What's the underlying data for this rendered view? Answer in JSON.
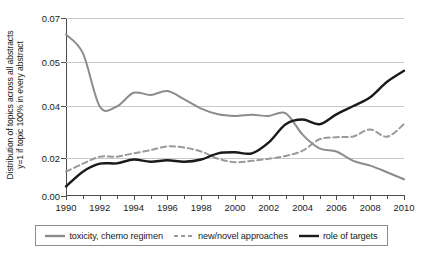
{
  "chart_data": {
    "type": "line",
    "title": "",
    "xlabel": "",
    "ylabel": "Distribution of topics across all abstracts y=1 if topic 100% in every abstract",
    "ylabel_line1": "Distribution of topics across all abstracts",
    "ylabel_line2": "y=1 if topic 100% in every abstract",
    "grid": true,
    "legend_position": "bottom",
    "xlim": [
      1990,
      2010
    ],
    "ylim": [
      0.0,
      0.07
    ],
    "xticks": [
      1990,
      1991,
      1992,
      1993,
      1994,
      1995,
      1996,
      1997,
      1998,
      1999,
      2000,
      2001,
      2002,
      2003,
      2004,
      2005,
      2006,
      2007,
      2008,
      2009,
      2010
    ],
    "xtick_labels": [
      "1990",
      "",
      "1992",
      "",
      "1994",
      "",
      "1996",
      "",
      "1998",
      "",
      "2000",
      "",
      "2002",
      "",
      "2004",
      "",
      "2006",
      "",
      "2008",
      "",
      "2010"
    ],
    "yticks": [
      0.0,
      0.02,
      0.04,
      0.05,
      0.07
    ],
    "ytick_labels": [
      "0.00",
      "0.02",
      "0.04",
      "0.05",
      "0.07"
    ],
    "x": [
      1990,
      1991,
      1992,
      1993,
      1994,
      1995,
      1996,
      1997,
      1998,
      1999,
      2000,
      2001,
      2002,
      2003,
      2004,
      2005,
      2006,
      2007,
      2008,
      2009,
      2010
    ],
    "series": [
      {
        "name": "toxicity, chemo regimen",
        "color": "#8c8c8c",
        "style": "solid",
        "width": 2.0,
        "values": [
          0.0625,
          0.054,
          0.0398,
          0.0398,
          0.043,
          0.0425,
          0.0434,
          0.0415,
          0.039,
          0.0368,
          0.0362,
          0.0366,
          0.0362,
          0.0372,
          0.029,
          0.0237,
          0.0225,
          0.0185,
          0.016,
          0.0125,
          0.0088
        ]
      },
      {
        "name": "new/novel approaches",
        "color": "#9a9a9a",
        "style": "dashed",
        "width": 2.0,
        "values": [
          0.0128,
          0.017,
          0.0205,
          0.0205,
          0.0218,
          0.023,
          0.0245,
          0.024,
          0.0225,
          0.0196,
          0.0178,
          0.0185,
          0.0196,
          0.0208,
          0.0228,
          0.0272,
          0.028,
          0.0283,
          0.031,
          0.0282,
          0.033
        ]
      },
      {
        "name": "role of targets",
        "color": "#1a1a1a",
        "style": "solid",
        "width": 2.4,
        "values": [
          0.005,
          0.0128,
          0.017,
          0.0172,
          0.0192,
          0.018,
          0.0188,
          0.018,
          0.0192,
          0.0218,
          0.0222,
          0.0218,
          0.026,
          0.033,
          0.0348,
          0.033,
          0.0368,
          0.04,
          0.042,
          0.0455,
          0.048
        ]
      }
    ]
  },
  "legend": {
    "items": [
      {
        "label": "toxicity, chemo regimen",
        "color": "#8c8c8c",
        "style": "solid"
      },
      {
        "label": "new/novel approaches",
        "color": "#9a9a9a",
        "style": "dashed"
      },
      {
        "label": "role of targets",
        "color": "#1a1a1a",
        "style": "solid"
      }
    ]
  }
}
